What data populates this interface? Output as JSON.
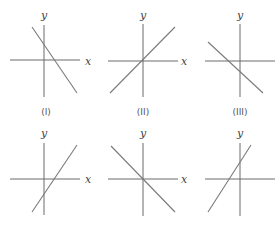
{
  "diagram": {
    "colors": {
      "axis": "#6a6a6a",
      "line": "#7a7a7a",
      "text": "#444444",
      "background": "#ffffff"
    },
    "graphs": [
      {
        "id": "top-left",
        "caption": "(I)",
        "y_label": "y",
        "x_label": "x",
        "slope_sign": "negative",
        "y_intercept_sign": "positive",
        "origin": [
          44,
          60
        ],
        "x_axis": [
          10,
          80
        ],
        "y_axis": [
          25,
          97
        ],
        "line": [
          [
            32,
            27
          ],
          [
            77,
            93
          ]
        ],
        "y_label_pos": [
          44,
          15
        ],
        "x_label_pos": [
          88,
          61
        ],
        "caption_pos": [
          46,
          112
        ]
      },
      {
        "id": "top-middle",
        "caption": "(II)",
        "y_label": "y",
        "x_label": "x",
        "slope_sign": "positive",
        "y_intercept_sign": "zero",
        "origin": [
          143,
          61
        ],
        "x_axis": [
          108,
          178
        ],
        "y_axis": [
          24,
          97
        ],
        "line": [
          [
            110,
            93
          ],
          [
            175,
            27
          ]
        ],
        "y_label_pos": [
          143,
          15
        ],
        "x_label_pos": [
          184,
          61
        ],
        "caption_pos": [
          143,
          112
        ]
      },
      {
        "id": "top-right",
        "caption": "(III)",
        "y_label": "y",
        "x_label": "",
        "slope_sign": "negative",
        "y_intercept_sign": "negative",
        "origin": [
          240,
          61
        ],
        "x_axis": [
          205,
          275
        ],
        "y_axis": [
          24,
          97
        ],
        "line": [
          [
            208,
            42
          ],
          [
            263,
            93
          ]
        ],
        "y_label_pos": [
          240,
          15
        ],
        "x_label_pos": null,
        "caption_pos": [
          240,
          112
        ]
      },
      {
        "id": "bottom-left",
        "caption": "",
        "y_label": "y",
        "x_label": "x",
        "slope_sign": "positive",
        "y_intercept_sign": "negative",
        "origin": [
          44,
          179
        ],
        "x_axis": [
          10,
          80
        ],
        "y_axis": [
          143,
          215
        ],
        "line": [
          [
            32,
            212
          ],
          [
            77,
            145
          ]
        ],
        "y_label_pos": [
          44,
          133
        ],
        "x_label_pos": [
          88,
          179
        ],
        "caption_pos": null
      },
      {
        "id": "bottom-middle",
        "caption": "",
        "y_label": "y",
        "x_label": "",
        "slope_sign": "negative",
        "y_intercept_sign": "zero",
        "origin": [
          143,
          179
        ],
        "x_axis": [
          108,
          178
        ],
        "y_axis": [
          143,
          216
        ],
        "line": [
          [
            111,
            146
          ],
          [
            175,
            212
          ]
        ],
        "y_label_pos": [
          143,
          133
        ],
        "x_label_pos": null,
        "caption_pos": null
      },
      {
        "id": "bottom-right",
        "caption": "",
        "y_label": "y",
        "x_label": "x",
        "slope_sign": "positive",
        "y_intercept_sign": "positive",
        "origin": [
          240,
          179
        ],
        "x_axis": [
          205,
          275
        ],
        "y_axis": [
          143,
          216
        ],
        "line": [
          [
            208,
            212
          ],
          [
            251,
            145
          ]
        ],
        "y_label_pos": [
          240,
          133
        ],
        "x_label_pos": [
          184,
          179
        ],
        "caption_pos": null
      }
    ]
  }
}
